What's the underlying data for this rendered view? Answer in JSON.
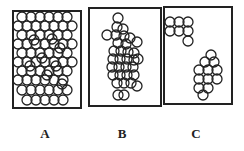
{
  "panels": [
    {
      "id": "A",
      "label": "A",
      "box": {
        "x": 13,
        "y": 11,
        "w": 68,
        "h": 97
      },
      "label_x": 45,
      "description": "dense uniform packing of circles filling the box"
    },
    {
      "id": "B",
      "label": "B",
      "box": {
        "x": 89,
        "y": 8,
        "w": 72,
        "h": 98
      },
      "label_x": 122,
      "description": "circles clustered densely in the center"
    },
    {
      "id": "C",
      "label": "C",
      "box": {
        "x": 164,
        "y": 7,
        "w": 68,
        "h": 97
      },
      "label_x": 196,
      "description": "two separate small clusters of circles"
    }
  ],
  "colors": {
    "stroke": "#222222",
    "background": "#ffffff"
  }
}
